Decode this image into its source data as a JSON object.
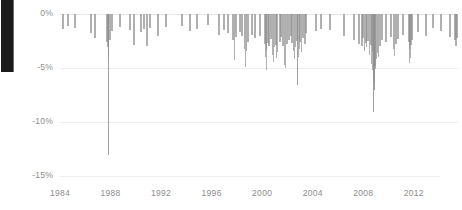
{
  "chart_data": {
    "type": "bar",
    "title": "",
    "subtitle": "",
    "xlabel": "",
    "ylabel": "",
    "orientation": "vertical-downward",
    "grid": true,
    "legend": null,
    "legend_position": "none",
    "bar_color": "#8f8f8f",
    "grid_color": "#f0eeec",
    "tick_label_color": "#8d8d8d",
    "xlim": [
      1984,
      2015.5
    ],
    "ylim": [
      -15,
      0
    ],
    "y_ticks": [
      0,
      -5,
      -10,
      -15
    ],
    "y_tick_labels": [
      "0%",
      "-5%",
      "-10%",
      "-15%"
    ],
    "x_ticks": [
      1984,
      1988,
      1992,
      1996,
      2000,
      2004,
      2008,
      2012
    ],
    "x_tick_labels": [
      "1984",
      "1988",
      "1992",
      "1996",
      "2000",
      "2004",
      "2008",
      "2012"
    ],
    "series_name": "Daily decline",
    "points": [
      {
        "x": 1984.15,
        "y": -1.4
      },
      {
        "x": 1984.55,
        "y": -1.1
      },
      {
        "x": 1985.1,
        "y": -1.3
      },
      {
        "x": 1986.35,
        "y": -1.8
      },
      {
        "x": 1986.7,
        "y": -2.2
      },
      {
        "x": 1987.62,
        "y": -2.6
      },
      {
        "x": 1987.7,
        "y": -3.1
      },
      {
        "x": 1987.76,
        "y": -4.2
      },
      {
        "x": 1987.79,
        "y": -13.1
      },
      {
        "x": 1987.83,
        "y": -3.6
      },
      {
        "x": 1987.88,
        "y": -2.4
      },
      {
        "x": 1988.05,
        "y": -1.6
      },
      {
        "x": 1988.7,
        "y": -1.2
      },
      {
        "x": 1989.45,
        "y": -1.5
      },
      {
        "x": 1989.8,
        "y": -2.9
      },
      {
        "x": 1990.3,
        "y": -1.7
      },
      {
        "x": 1990.6,
        "y": -1.4
      },
      {
        "x": 1990.78,
        "y": -3.0
      },
      {
        "x": 1991.05,
        "y": -1.3
      },
      {
        "x": 1991.7,
        "y": -2.0
      },
      {
        "x": 1992.3,
        "y": -1.2
      },
      {
        "x": 1993.55,
        "y": -1.1
      },
      {
        "x": 1994.2,
        "y": -1.6
      },
      {
        "x": 1994.75,
        "y": -1.4
      },
      {
        "x": 1995.6,
        "y": -1.0
      },
      {
        "x": 1996.5,
        "y": -1.9
      },
      {
        "x": 1996.9,
        "y": -1.5
      },
      {
        "x": 1997.25,
        "y": -1.8
      },
      {
        "x": 1997.62,
        "y": -2.4
      },
      {
        "x": 1997.8,
        "y": -4.3
      },
      {
        "x": 1997.85,
        "y": -2.1
      },
      {
        "x": 1998.15,
        "y": -1.7
      },
      {
        "x": 1998.36,
        "y": -2.0
      },
      {
        "x": 1998.6,
        "y": -3.2
      },
      {
        "x": 1998.66,
        "y": -4.9
      },
      {
        "x": 1998.72,
        "y": -3.4
      },
      {
        "x": 1998.8,
        "y": -2.6
      },
      {
        "x": 1999.1,
        "y": -1.9
      },
      {
        "x": 1999.35,
        "y": -2.2
      },
      {
        "x": 1999.72,
        "y": -2.0
      },
      {
        "x": 2000.12,
        "y": -2.8
      },
      {
        "x": 2000.22,
        "y": -4.0
      },
      {
        "x": 2000.28,
        "y": -3.3
      },
      {
        "x": 2000.34,
        "y": -5.2
      },
      {
        "x": 2000.41,
        "y": -2.7
      },
      {
        "x": 2000.5,
        "y": -3.0
      },
      {
        "x": 2000.62,
        "y": -2.3
      },
      {
        "x": 2000.74,
        "y": -3.8
      },
      {
        "x": 2000.82,
        "y": -4.4
      },
      {
        "x": 2000.9,
        "y": -3.1
      },
      {
        "x": 2001.05,
        "y": -2.9
      },
      {
        "x": 2001.12,
        "y": -4.1
      },
      {
        "x": 2001.2,
        "y": -3.5
      },
      {
        "x": 2001.3,
        "y": -2.6
      },
      {
        "x": 2001.42,
        "y": -2.1
      },
      {
        "x": 2001.55,
        "y": -3.0
      },
      {
        "x": 2001.72,
        "y": -4.7
      },
      {
        "x": 2001.78,
        "y": -5.0
      },
      {
        "x": 2001.85,
        "y": -2.8
      },
      {
        "x": 2002.05,
        "y": -2.4
      },
      {
        "x": 2002.18,
        "y": -2.0
      },
      {
        "x": 2002.3,
        "y": -2.7
      },
      {
        "x": 2002.45,
        "y": -3.4
      },
      {
        "x": 2002.55,
        "y": -4.2
      },
      {
        "x": 2002.62,
        "y": -3.1
      },
      {
        "x": 2002.68,
        "y": -2.5
      },
      {
        "x": 2002.74,
        "y": -6.6
      },
      {
        "x": 2002.8,
        "y": -4.0
      },
      {
        "x": 2002.88,
        "y": -3.2
      },
      {
        "x": 2002.95,
        "y": -2.6
      },
      {
        "x": 2003.1,
        "y": -3.5
      },
      {
        "x": 2003.18,
        "y": -2.2
      },
      {
        "x": 2003.3,
        "y": -2.8
      },
      {
        "x": 2003.4,
        "y": -1.8
      },
      {
        "x": 2004.2,
        "y": -1.6
      },
      {
        "x": 2004.6,
        "y": -1.4
      },
      {
        "x": 2005.3,
        "y": -1.5
      },
      {
        "x": 2006.4,
        "y": -2.0
      },
      {
        "x": 2007.2,
        "y": -2.4
      },
      {
        "x": 2007.55,
        "y": -2.8
      },
      {
        "x": 2007.8,
        "y": -3.0
      },
      {
        "x": 2007.92,
        "y": -2.2
      },
      {
        "x": 2008.05,
        "y": -3.4
      },
      {
        "x": 2008.12,
        "y": -2.7
      },
      {
        "x": 2008.2,
        "y": -3.1
      },
      {
        "x": 2008.3,
        "y": -2.5
      },
      {
        "x": 2008.42,
        "y": -3.8
      },
      {
        "x": 2008.52,
        "y": -2.9
      },
      {
        "x": 2008.62,
        "y": -4.6
      },
      {
        "x": 2008.68,
        "y": -3.4
      },
      {
        "x": 2008.72,
        "y": -5.2
      },
      {
        "x": 2008.76,
        "y": -6.0
      },
      {
        "x": 2008.79,
        "y": -9.1
      },
      {
        "x": 2008.82,
        "y": -7.0
      },
      {
        "x": 2008.85,
        "y": -5.6
      },
      {
        "x": 2008.88,
        "y": -6.4
      },
      {
        "x": 2008.91,
        "y": -4.8
      },
      {
        "x": 2008.95,
        "y": -5.1
      },
      {
        "x": 2009.02,
        "y": -4.2
      },
      {
        "x": 2009.1,
        "y": -3.6
      },
      {
        "x": 2009.18,
        "y": -4.0
      },
      {
        "x": 2009.28,
        "y": -3.0
      },
      {
        "x": 2009.4,
        "y": -2.4
      },
      {
        "x": 2009.7,
        "y": -2.6
      },
      {
        "x": 2010.12,
        "y": -2.1
      },
      {
        "x": 2010.38,
        "y": -3.2
      },
      {
        "x": 2010.45,
        "y": -3.9
      },
      {
        "x": 2010.55,
        "y": -2.8
      },
      {
        "x": 2010.7,
        "y": -2.3
      },
      {
        "x": 2011.05,
        "y": -1.9
      },
      {
        "x": 2011.58,
        "y": -2.6
      },
      {
        "x": 2011.6,
        "y": -4.5
      },
      {
        "x": 2011.64,
        "y": -3.2
      },
      {
        "x": 2011.68,
        "y": -4.1
      },
      {
        "x": 2011.72,
        "y": -2.9
      },
      {
        "x": 2011.8,
        "y": -2.4
      },
      {
        "x": 2012.25,
        "y": -1.7
      },
      {
        "x": 2012.85,
        "y": -2.0
      },
      {
        "x": 2013.45,
        "y": -1.3
      },
      {
        "x": 2014.1,
        "y": -1.6
      },
      {
        "x": 2014.8,
        "y": -2.1
      },
      {
        "x": 2015.2,
        "y": -2.4
      },
      {
        "x": 2015.3,
        "y": -3.0
      },
      {
        "x": 2015.36,
        "y": -2.2
      }
    ]
  }
}
